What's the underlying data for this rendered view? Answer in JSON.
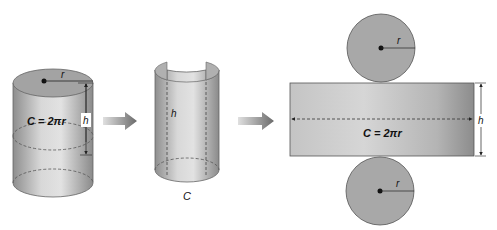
{
  "diagram": {
    "steps": [
      {
        "id": "closed-cylinder",
        "labels": {
          "radius": "r",
          "height": "h",
          "circumference": "C = 2πr"
        }
      },
      {
        "id": "cut-cylinder",
        "labels": {
          "height": "h",
          "circumference": "C"
        }
      },
      {
        "id": "net",
        "labels": {
          "top_radius": "r",
          "bottom_radius": "r",
          "height": "h",
          "width": "C = 2πr"
        }
      }
    ],
    "arrows": [
      {
        "from": "closed-cylinder",
        "to": "cut-cylinder"
      },
      {
        "from": "cut-cylinder",
        "to": "net"
      }
    ],
    "colors": {
      "shape_light": "#d9d9d9",
      "shape_dark": "#8f8f8f",
      "circle_fill": "#a9a9a9",
      "outline": "#555555",
      "ink": "#111111"
    }
  }
}
